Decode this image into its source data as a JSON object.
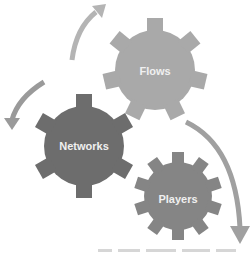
{
  "gears": [
    {
      "label": "Flows",
      "color": "#a9a9a9"
    },
    {
      "label": "Networks",
      "color": "#6d6d6d"
    },
    {
      "label": "Players",
      "color": "#858585"
    }
  ],
  "arrows": {
    "color_light": "#b4b4b4",
    "color_dark": "#8a8a8a"
  },
  "caption": {
    "visible": true
  }
}
